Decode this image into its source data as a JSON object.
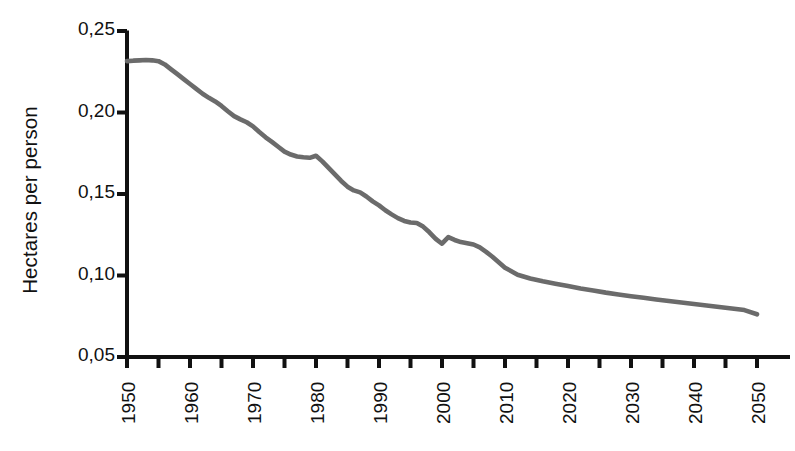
{
  "chart_data": {
    "type": "line",
    "title": "",
    "subtitle": "",
    "xlabel": "",
    "ylabel": "Hectares per person",
    "xlim": [
      1950,
      2050
    ],
    "ylim": [
      0.05,
      0.25
    ],
    "grid": false,
    "legend": false,
    "legend_position": "none",
    "line_color": "#6b6b6b",
    "axis_color": "#111111",
    "background_color": "#ffffff",
    "y_tick_labels": [
      "0,25",
      "0,20",
      "0,15",
      "0,10",
      "0,05"
    ],
    "y_tick_values": [
      0.25,
      0.2,
      0.15,
      0.1,
      0.05
    ],
    "x_tick_labels": [
      "1950",
      "1960",
      "1970",
      "1980",
      "1990",
      "2000",
      "2010",
      "2020",
      "2030",
      "2040",
      "2050"
    ],
    "x_tick_values": [
      1950,
      1960,
      1970,
      1980,
      1990,
      2000,
      2010,
      2020,
      2030,
      2040,
      2050
    ],
    "x_minor_tick_values": [
      1955,
      1965,
      1975,
      1985,
      1995,
      2005,
      2015,
      2025,
      2035,
      2045
    ],
    "series": [
      {
        "name": "Hectares per person",
        "x": [
          1950,
          1951,
          1952,
          1953,
          1954,
          1955,
          1956,
          1957,
          1958,
          1959,
          1960,
          1961,
          1962,
          1963,
          1964,
          1965,
          1966,
          1967,
          1968,
          1969,
          1970,
          1971,
          1972,
          1973,
          1974,
          1975,
          1976,
          1977,
          1978,
          1979,
          1980,
          1981,
          1982,
          1983,
          1984,
          1985,
          1986,
          1987,
          1988,
          1989,
          1990,
          1991,
          1992,
          1993,
          1994,
          1995,
          1996,
          1997,
          1998,
          1999,
          2000,
          2001,
          2002,
          2003,
          2004,
          2005,
          2006,
          2007,
          2008,
          2009,
          2010,
          2012,
          2014,
          2016,
          2018,
          2020,
          2022,
          2024,
          2026,
          2028,
          2030,
          2032,
          2034,
          2036,
          2038,
          2040,
          2042,
          2044,
          2046,
          2048,
          2050
        ],
        "y": [
          0.2315,
          0.2318,
          0.232,
          0.2322,
          0.232,
          0.2315,
          0.2295,
          0.2265,
          0.2235,
          0.2205,
          0.2175,
          0.2145,
          0.2115,
          0.209,
          0.2068,
          0.204,
          0.2008,
          0.1978,
          0.1958,
          0.194,
          0.1915,
          0.188,
          0.1848,
          0.182,
          0.179,
          0.176,
          0.1742,
          0.173,
          0.1725,
          0.1722,
          0.1735,
          0.17,
          0.166,
          0.162,
          0.158,
          0.1545,
          0.1522,
          0.151,
          0.1485,
          0.1455,
          0.143,
          0.14,
          0.1375,
          0.1352,
          0.1335,
          0.1325,
          0.1322,
          0.13,
          0.1265,
          0.1225,
          0.1195,
          0.1235,
          0.1218,
          0.1205,
          0.1198,
          0.119,
          0.1172,
          0.1145,
          0.1115,
          0.1082,
          0.1048,
          0.1005,
          0.0982,
          0.0965,
          0.095,
          0.0935,
          0.092,
          0.0908,
          0.0895,
          0.0884,
          0.0873,
          0.0863,
          0.0853,
          0.0843,
          0.0834,
          0.0825,
          0.0816,
          0.0807,
          0.0798,
          0.0788,
          0.0762
        ]
      }
    ]
  },
  "axes": {
    "y_axis_title": "Hectares per person"
  }
}
